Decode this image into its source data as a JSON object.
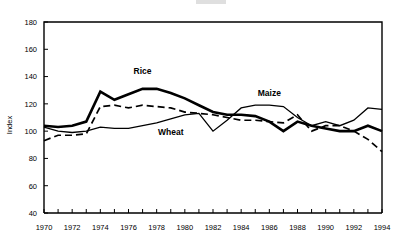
{
  "chart_data": {
    "type": "line",
    "title": "",
    "xlabel": "",
    "ylabel": "Index",
    "xlim": [
      1970,
      1994
    ],
    "ylim": [
      40,
      180
    ],
    "ytick_step": 20,
    "yticks": [
      40,
      60,
      80,
      100,
      120,
      140,
      160,
      180
    ],
    "xticks": [
      1970,
      1972,
      1974,
      1976,
      1978,
      1980,
      1982,
      1984,
      1986,
      1988,
      1990,
      1992,
      1994
    ],
    "xtick_labels": [
      "1970",
      "1972",
      "1974",
      "1976",
      "1978",
      "1980",
      "1982",
      "1984",
      "1986",
      "1988",
      "1990",
      "1992",
      "1994"
    ],
    "ytick_labels": [
      "40",
      "60",
      "80",
      "100",
      "120",
      "140",
      "160",
      "180"
    ],
    "minor_xticks_every": 1,
    "grid": false,
    "legend": "inline-annotations",
    "x": [
      1970,
      1971,
      1972,
      1973,
      1974,
      1975,
      1976,
      1977,
      1978,
      1979,
      1980,
      1981,
      1982,
      1983,
      1984,
      1985,
      1986,
      1987,
      1988,
      1989,
      1990,
      1991,
      1992,
      1993,
      1994
    ],
    "series": [
      {
        "name": "Rice",
        "style": "thick-solid",
        "values": [
          104,
          103,
          104,
          107,
          129,
          123,
          127,
          131,
          131,
          128,
          124,
          119,
          114,
          112,
          112,
          111,
          107,
          100,
          107,
          104,
          102,
          100,
          100,
          104,
          100
        ]
      },
      {
        "name": "Wheat",
        "style": "thin-solid",
        "values": [
          103,
          100,
          99,
          100,
          103,
          102,
          102,
          104,
          106,
          109,
          112,
          113,
          100,
          108,
          117,
          119,
          119,
          118,
          110,
          104,
          107,
          104,
          108,
          117,
          116
        ]
      },
      {
        "name": "Maize",
        "style": "dashed",
        "values": [
          93,
          97,
          97,
          98,
          118,
          119,
          117,
          119,
          118,
          117,
          114,
          113,
          112,
          110,
          108,
          108,
          107,
          106,
          112,
          100,
          104,
          104,
          100,
          94,
          85
        ]
      }
    ],
    "annotations": [
      {
        "text": "Rice",
        "x": 1977,
        "y": 142
      },
      {
        "text": "Wheat",
        "x": 1979,
        "y": 97
      },
      {
        "text": "Maize",
        "x": 1986,
        "y": 126
      }
    ]
  }
}
